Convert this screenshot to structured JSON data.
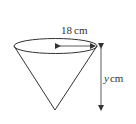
{
  "diagram": {
    "shape": "inverted cone",
    "radius_label": {
      "value": "18",
      "unit": "cm"
    },
    "height_label": {
      "variable": "y",
      "unit": "cm"
    },
    "colors": {
      "stroke": "#333333",
      "background": "#ffffff"
    }
  }
}
